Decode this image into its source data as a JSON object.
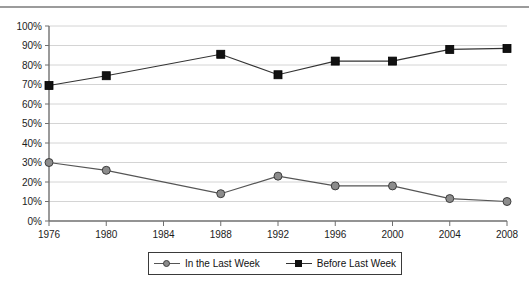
{
  "title": {
    "text": "1976–2008",
    "cut_off": true
  },
  "chart_data": {
    "type": "line",
    "title": "1976–2008",
    "xlabel": "",
    "ylabel": "",
    "x": [
      1976,
      1980,
      1984,
      1988,
      1992,
      1996,
      2000,
      2004,
      2008
    ],
    "xtick_labels": [
      "1976",
      "1980",
      "1984",
      "1988",
      "1992",
      "1996",
      "2000",
      "2004",
      "2008"
    ],
    "ytick_labels": [
      "0%",
      "10%",
      "20%",
      "30%",
      "40%",
      "50%",
      "60%",
      "70%",
      "80%",
      "90%",
      "100%"
    ],
    "ytick_values": [
      0,
      10,
      20,
      30,
      40,
      50,
      60,
      70,
      80,
      90,
      100
    ],
    "ylim": [
      0,
      100
    ],
    "xlim": [
      1976,
      2008
    ],
    "grid": "horizontal",
    "legend_position": "bottom",
    "series": [
      {
        "name": "In the Last Week",
        "marker": "circle",
        "color": "#808080",
        "line_color": "#555555",
        "x": [
          1976,
          1980,
          1988,
          1992,
          1996,
          2000,
          2004,
          2008
        ],
        "values": [
          30,
          26,
          14,
          23,
          18,
          18,
          11.5,
          10
        ]
      },
      {
        "name": "Before Last Week",
        "marker": "square",
        "color": "#111111",
        "line_color": "#333333",
        "x": [
          1976,
          1980,
          1988,
          1992,
          1996,
          2000,
          2004,
          2008
        ],
        "values": [
          69.5,
          74.5,
          85.5,
          75,
          82,
          82,
          88,
          88.5
        ]
      }
    ]
  },
  "legend": {
    "entries": [
      {
        "label": "In the Last Week",
        "marker": "circle-marker-icon",
        "color": "#808080"
      },
      {
        "label": "Before Last Week",
        "marker": "square-marker-icon",
        "color": "#111111"
      }
    ]
  },
  "colors": {
    "grid": "#d4d4d4",
    "axis": "#6f6f6f",
    "rule": "#9b9b9b",
    "series_gray": "#808080",
    "series_black": "#111111",
    "background": "#ffffff"
  }
}
